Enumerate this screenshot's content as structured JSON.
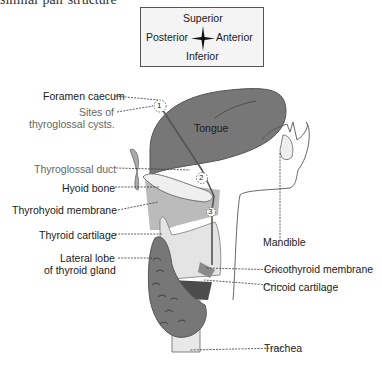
{
  "header_fragment": "similar pair structure",
  "orientation": {
    "superior": "Superior",
    "posterior": "Posterior",
    "anterior": "Anterior",
    "inferior": "Inferior"
  },
  "labels_left": [
    {
      "id": "foramen-caecum",
      "text": "Foramen caecum"
    },
    {
      "id": "sites-cysts-1",
      "text": "Sites of"
    },
    {
      "id": "sites-cysts-2",
      "text": "thyroglossal cysts."
    },
    {
      "id": "thyroglossal-duct",
      "text": "Thyroglossal duct"
    },
    {
      "id": "hyoid-bone",
      "text": "Hyoid bone"
    },
    {
      "id": "thyrohyoid-membrane",
      "text": "Thyrohyoid membrane"
    },
    {
      "id": "thyroid-cartilage",
      "text": "Thyroid cartilage"
    },
    {
      "id": "lateral-lobe-1",
      "text": "Lateral lobe"
    },
    {
      "id": "lateral-lobe-2",
      "text": "of thyroid gland"
    }
  ],
  "labels_right": [
    {
      "id": "tongue",
      "text": "Tongue"
    },
    {
      "id": "mandible",
      "text": "Mandible"
    },
    {
      "id": "cricothyroid-membrane",
      "text": "Cricothyroid membrane"
    },
    {
      "id": "cricoid-cartilage",
      "text": "Cricoid cartilage"
    },
    {
      "id": "trachea",
      "text": "Trachea"
    }
  ],
  "cyst_sites": [
    "1",
    "2",
    "3"
  ],
  "colors": {
    "dark": "#6e6e6e",
    "mid": "#a8a8a8",
    "light": "#e2e2e2",
    "darkest": "#4a4a4a"
  }
}
